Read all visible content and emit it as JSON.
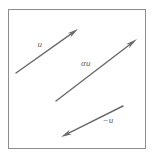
{
  "figure": {
    "width": 153,
    "height": 157,
    "background_color": "#ffffff",
    "border": {
      "name": "figure-border",
      "x": 8,
      "y": 9,
      "width": 137,
      "height": 139,
      "color": "#8d8d8d",
      "stroke_width": 1
    },
    "stroke_color": "#6a6a6a",
    "label_color": "#5f5f5f",
    "vectors": [
      {
        "id": "u",
        "label": "u",
        "label_x": 40,
        "label_y": 47,
        "x1": 16,
        "y1": 73,
        "x2": 78,
        "y2": 29,
        "stroke_width": 1.4,
        "head_length": 11,
        "head_width": 5
      },
      {
        "id": "alpha-u",
        "label": "αu",
        "label_x": 86,
        "label_y": 66,
        "x1": 56,
        "y1": 101,
        "x2": 137,
        "y2": 39,
        "stroke_width": 1.4,
        "head_length": 12,
        "head_width": 5
      },
      {
        "id": "minus-u",
        "label": "−u",
        "label_x": 108,
        "label_y": 123,
        "x1": 123,
        "y1": 106,
        "x2": 61,
        "y2": 137,
        "stroke_width": 1.4,
        "head_length": 11,
        "head_width": 5
      }
    ]
  }
}
